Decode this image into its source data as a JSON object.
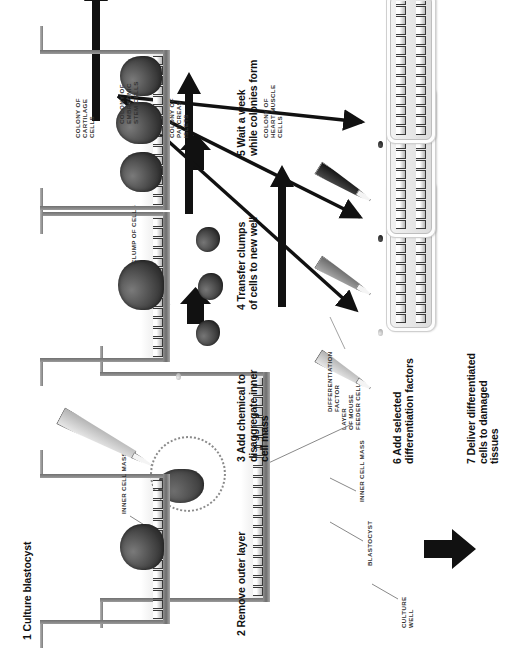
{
  "figure": {
    "orientation": "rotated-90-ccw"
  },
  "steps": [
    {
      "id": 1,
      "label": "1 Culture blastocyst"
    },
    {
      "id": 2,
      "label": "2 Remove outer layer"
    },
    {
      "id": 3,
      "label": "3 Add chemical to\ndisaggregate inner\ncell mass"
    },
    {
      "id": 4,
      "label": "4 Transfer clumps\nof cells to new well"
    },
    {
      "id": 5,
      "label": "5 Wait a week\nwhile colonies form"
    },
    {
      "id": 6,
      "label": "6 Add selected\ndifferentiation factors"
    },
    {
      "id": 7,
      "label": "7 Deliver differentiated\ncells to damaged\ntissues"
    }
  ],
  "callouts": {
    "culture_well": "CULTURE\nWELL",
    "blastocyst": "BLASTOCYST",
    "inner_cell_mass_1": "INNER CELL MASS",
    "feeder_layer": "LAYER\nOF MOUSE\nFEEDER CELLS",
    "inner_cell_mass_2": "INNER CELL MASS",
    "clump_of_cells": "CLUMP OF CELLS",
    "colony_embryonic": "COLONY OF\nEMBRYONIC\nSTEM CELLS",
    "differentiation_factor": "DIFFERENTIATION\nFACTOR"
  },
  "outcomes": [
    {
      "label": "COLONY OF\nHEART MUSCLE\nCELLS"
    },
    {
      "label": "COLONY OF\nPANCREAS\nISLETS"
    },
    {
      "label": "COLONY OF\nCARTILAGE\nCELLS"
    }
  ],
  "colors": {
    "background": "#ffffff",
    "ink": "#1a1a1a",
    "arrow": "#111111",
    "well_wall": "#8e8e8e",
    "cell_mass": "#343434",
    "feeder_cell": "#3a3a3a",
    "pipette_light": "#d2d2d2",
    "pipette_mid": "#8a8a8a",
    "pipette_dark": "#1a1a1a"
  }
}
